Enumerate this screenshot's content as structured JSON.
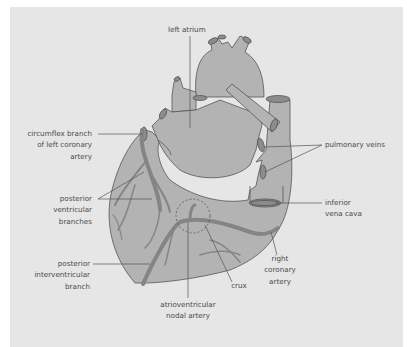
{
  "diagram": {
    "colors": {
      "background": "#e6e6e6",
      "heart_fill": "#b3b3b3",
      "artery": "#858585",
      "outline": "#555555",
      "leader": "#555555",
      "text": "#4a4a4a"
    },
    "labels": {
      "left_atrium": "left atrium",
      "circumflex_1": "circumflex branch",
      "circumflex_2": "of left coronary",
      "circumflex_3": "artery",
      "pulmonary_veins": "pulmonary veins",
      "posterior_ventricular_1": "posterior",
      "posterior_ventricular_2": "ventricular",
      "posterior_ventricular_3": "branches",
      "inferior_vena_cava_1": "inferior",
      "inferior_vena_cava_2": "vena cava",
      "posterior_interventricular_1": "posterior",
      "posterior_interventricular_2": "interventricular",
      "posterior_interventricular_3": "branch",
      "right_coronary_1": "right",
      "right_coronary_2": "coronary",
      "right_coronary_3": "artery",
      "crux": "crux",
      "av_nodal_1": "atrioventricular",
      "av_nodal_2": "nodal artery"
    }
  }
}
